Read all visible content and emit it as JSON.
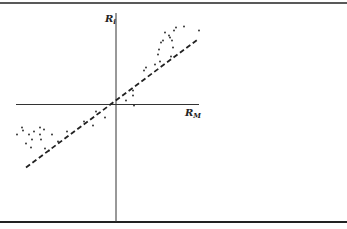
{
  "chart_data": {
    "type": "scatter",
    "title": "",
    "xlabel": "R_M",
    "ylabel": "R_i",
    "xlabel_main": "R",
    "xlabel_sub": "M",
    "ylabel_main": "R",
    "ylabel_sub": "i",
    "grid": false,
    "legend": null,
    "axes_through_origin": true,
    "xlim": [
      -10,
      8.5
    ],
    "ylim": [
      -11.8,
      9.1
    ],
    "series": [
      {
        "name": "observations",
        "kind": "points",
        "points": [
          [
            -9.9,
            -3.0
          ],
          [
            -9.4,
            -2.3
          ],
          [
            -9.3,
            -2.6
          ],
          [
            -9.0,
            -3.9
          ],
          [
            -8.7,
            -3.0
          ],
          [
            -8.4,
            -3.5
          ],
          [
            -8.2,
            -2.7
          ],
          [
            -8.5,
            -4.3
          ],
          [
            -7.6,
            -2.3
          ],
          [
            -7.2,
            -2.5
          ],
          [
            -7.6,
            -3.0
          ],
          [
            -7.5,
            -3.5
          ],
          [
            -7.1,
            -4.4
          ],
          [
            -6.7,
            -4.6
          ],
          [
            -6.4,
            -3.0
          ],
          [
            -5.8,
            -3.7
          ],
          [
            -4.9,
            -2.7
          ],
          [
            -3.2,
            -1.7
          ],
          [
            -2.3,
            -2.1
          ],
          [
            -2.0,
            -0.7
          ],
          [
            -1.1,
            -1.3
          ],
          [
            1.0,
            0.4
          ],
          [
            1.7,
            0.9
          ],
          [
            1.7,
            1.4
          ],
          [
            1.8,
            -0.1
          ],
          [
            2.8,
            3.4
          ],
          [
            3.0,
            3.7
          ],
          [
            3.9,
            4.0
          ],
          [
            4.4,
            4.3
          ],
          [
            4.5,
            6.2
          ],
          [
            4.3,
            5.5
          ],
          [
            4.2,
            5.0
          ],
          [
            4.7,
            6.4
          ],
          [
            4.9,
            7.2
          ],
          [
            5.4,
            6.7
          ],
          [
            5.3,
            6.9
          ],
          [
            5.6,
            6.4
          ],
          [
            5.7,
            5.7
          ],
          [
            5.5,
            4.8
          ],
          [
            5.8,
            7.4
          ],
          [
            6.0,
            7.7
          ],
          [
            6.8,
            7.8
          ],
          [
            8.3,
            7.4
          ]
        ]
      },
      {
        "name": "fitted line",
        "kind": "dashed-line",
        "from": [
          -9.0,
          -6.3
        ],
        "to": [
          8.3,
          6.6
        ],
        "slope": 0.75,
        "intercept": 0.0
      }
    ]
  },
  "colors": {
    "ink": "#222222",
    "background": "#ffffff"
  }
}
